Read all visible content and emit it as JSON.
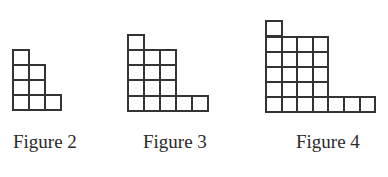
{
  "figures": [
    {
      "label": "Figure 2",
      "column_heights": [
        4,
        3,
        1
      ],
      "grid": {
        "left": 13,
        "bottom": 110,
        "cell_w": 16,
        "cell_h": 15
      },
      "label_pos": {
        "left": 13,
        "top": 132
      }
    },
    {
      "label": "Figure 3",
      "column_heights": [
        5,
        4,
        4,
        1,
        1
      ],
      "grid": {
        "left": 128,
        "bottom": 111,
        "cell_w": 16,
        "cell_h": 15.3
      },
      "label_pos": {
        "left": 143,
        "top": 132
      }
    },
    {
      "label": "Figure 4",
      "column_heights": [
        6,
        5,
        5,
        5,
        1,
        1,
        1
      ],
      "grid": {
        "left": 266,
        "bottom": 112,
        "cell_w": 15.6,
        "cell_h": 15.1
      },
      "label_pos": {
        "left": 296,
        "top": 132
      }
    }
  ],
  "colors": {
    "line": "#333333",
    "text": "#2a2a2a",
    "background": "#ffffff"
  }
}
